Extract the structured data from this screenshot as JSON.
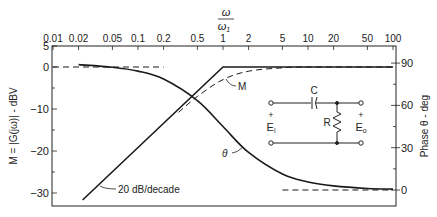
{
  "chart_data": {
    "type": "line",
    "title": "",
    "x_top_label_num": "ω",
    "x_top_label_den": "ω1",
    "xscale": "log",
    "xlim": [
      0.01,
      100
    ],
    "x_ticks": [
      "0.01",
      "0.02",
      "0.05",
      "0.1",
      "0.2",
      "0.5",
      "1",
      "2",
      "5",
      "10",
      "20",
      "50",
      "100"
    ],
    "ylabel_left": "M = |G(jω)| - dBV",
    "ylim_left": [
      -32,
      5
    ],
    "y_ticks_left": [
      "5",
      "0",
      "-10",
      "-20",
      "-30"
    ],
    "ylabel_right": "Phase θ - deg",
    "ylim_right": [
      -5,
      95
    ],
    "y_ticks_right": [
      "90",
      "60",
      "30",
      "0"
    ],
    "grid": false,
    "series": [
      {
        "name": "M (asymptote)",
        "axis": "left",
        "style": "solid",
        "x": [
          0.02,
          1,
          100
        ],
        "y": [
          -34,
          0,
          0
        ]
      },
      {
        "name": "M",
        "axis": "left",
        "style": "dashed",
        "x": [
          0.3,
          0.5,
          1,
          2,
          5,
          10,
          100
        ],
        "y": [
          -10.8,
          -7,
          -3,
          -1,
          -0.2,
          0,
          0
        ]
      },
      {
        "name": "0 dB asymptote",
        "axis": "left",
        "style": "dashed",
        "x": [
          0.01,
          0.2
        ],
        "y": [
          0,
          0
        ]
      },
      {
        "name": "θ",
        "axis": "right",
        "style": "solid",
        "x": [
          0.02,
          0.05,
          0.1,
          0.2,
          0.5,
          1,
          2,
          5,
          10,
          20,
          50,
          100
        ],
        "y": [
          88.9,
          87.1,
          84.3,
          78.7,
          63.4,
          45,
          26.6,
          11.3,
          5.7,
          2.9,
          1.1,
          0.6
        ]
      },
      {
        "name": "0° asymptote",
        "axis": "right",
        "style": "dashed",
        "x": [
          5,
          100
        ],
        "y": [
          0,
          0
        ]
      }
    ],
    "annotations": [
      "M",
      "θ",
      "20 dB/decade"
    ]
  },
  "labels": {
    "omega": "ω",
    "omega1": "ω",
    "omega1_sub": "1",
    "ylabel_left": "M = |G(jω)| - dBV",
    "ylabel_right": "Phase θ - deg",
    "annot_M": "M",
    "annot_theta": "θ",
    "annot_slope": "20 dB/decade"
  },
  "circuit": {
    "capacitor": "C",
    "resistor": "R",
    "input_plus": "+",
    "input": "E",
    "input_sub": "i",
    "output_plus": "+",
    "output": "E",
    "output_sub": "o"
  },
  "ticks": {
    "x": [
      {
        "v": 0.01,
        "label": "0.01"
      },
      {
        "v": 0.02,
        "label": "0.02"
      },
      {
        "v": 0.05,
        "label": "0.05"
      },
      {
        "v": 0.1,
        "label": "0.1"
      },
      {
        "v": 0.2,
        "label": "0.2"
      },
      {
        "v": 0.5,
        "label": "0.5"
      },
      {
        "v": 1,
        "label": "1"
      },
      {
        "v": 2,
        "label": "2"
      },
      {
        "v": 5,
        "label": "5"
      },
      {
        "v": 10,
        "label": "10"
      },
      {
        "v": 20,
        "label": "20"
      },
      {
        "v": 50,
        "label": "50"
      },
      {
        "v": 100,
        "label": "100"
      }
    ],
    "left": [
      {
        "v": 5,
        "label": "5"
      },
      {
        "v": 0,
        "label": "0"
      },
      {
        "v": -10,
        "label": "-10"
      },
      {
        "v": -20,
        "label": "-20"
      },
      {
        "v": -30,
        "label": "-30"
      }
    ],
    "left_minor": [
      -5,
      -15,
      -25
    ],
    "right": [
      {
        "v": 90,
        "label": "90"
      },
      {
        "v": 60,
        "label": "60"
      },
      {
        "v": 30,
        "label": "30"
      },
      {
        "v": 0,
        "label": "0"
      }
    ],
    "right_minor": [
      75,
      45,
      15
    ]
  }
}
